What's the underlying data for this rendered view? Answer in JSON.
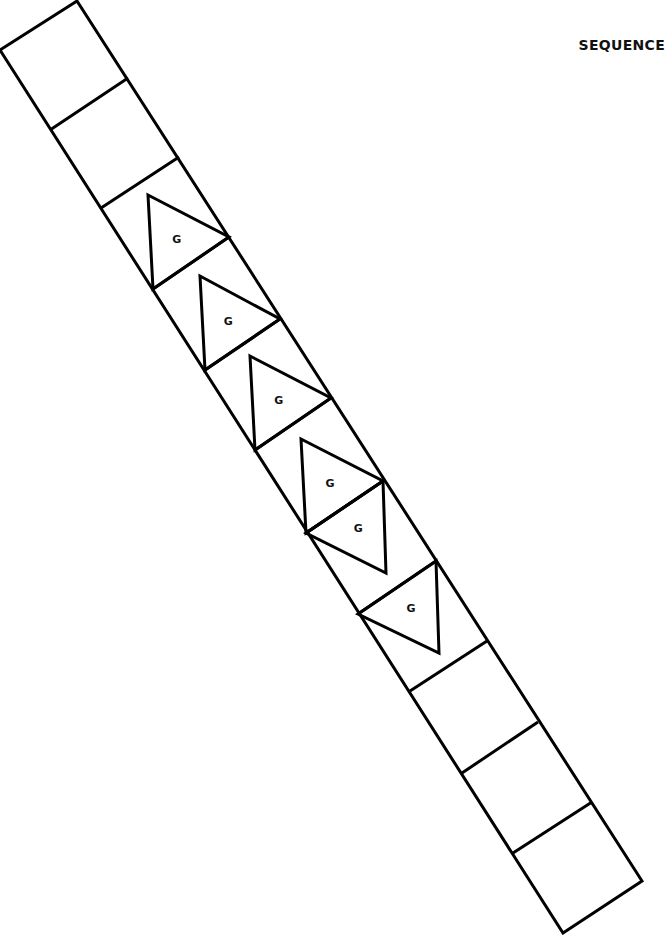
{
  "title": "SEQUENCE",
  "strip": {
    "cell_count": 11,
    "cells": [
      {
        "index": 0,
        "shapes": []
      },
      {
        "index": 1,
        "shapes": []
      },
      {
        "index": 2,
        "shapes": [
          {
            "type": "triangle",
            "orientation": "up-left",
            "label": "G"
          }
        ]
      },
      {
        "index": 3,
        "shapes": [
          {
            "type": "triangle",
            "orientation": "up-left",
            "label": "G"
          }
        ]
      },
      {
        "index": 4,
        "shapes": [
          {
            "type": "triangle",
            "orientation": "up-left",
            "label": "G"
          }
        ]
      },
      {
        "index": 5,
        "shapes": [
          {
            "type": "triangle",
            "orientation": "up-left",
            "label": "G"
          }
        ]
      },
      {
        "index": 6,
        "shapes": [
          {
            "type": "triangle",
            "orientation": "down-right",
            "label": "G"
          }
        ]
      },
      {
        "index": 7,
        "shapes": [
          {
            "type": "triangle",
            "orientation": "down-right",
            "label": "G"
          }
        ]
      },
      {
        "index": 8,
        "shapes": []
      },
      {
        "index": 9,
        "shapes": []
      },
      {
        "index": 10,
        "shapes": []
      }
    ]
  },
  "colors": {
    "stroke": "#000000",
    "background": "#ffffff",
    "text": "#111111"
  }
}
